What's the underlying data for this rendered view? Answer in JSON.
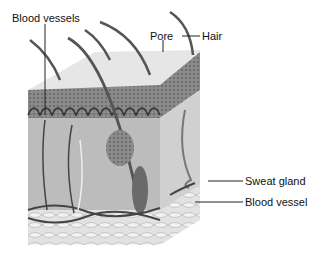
{
  "diagram": {
    "labels": {
      "blood_vessels": "Blood vessels",
      "pore": "Pore",
      "hair": "Hair",
      "sweat_gland": "Sweat gland",
      "blood_vessel": "Blood vessel"
    },
    "colors": {
      "surface": "#e4e4e4",
      "epidermis": "#8a8a8a",
      "dermis": "#b8b8b8",
      "fat": "#dcdcdc",
      "hair": "#555555",
      "vessel": "#444444"
    }
  }
}
